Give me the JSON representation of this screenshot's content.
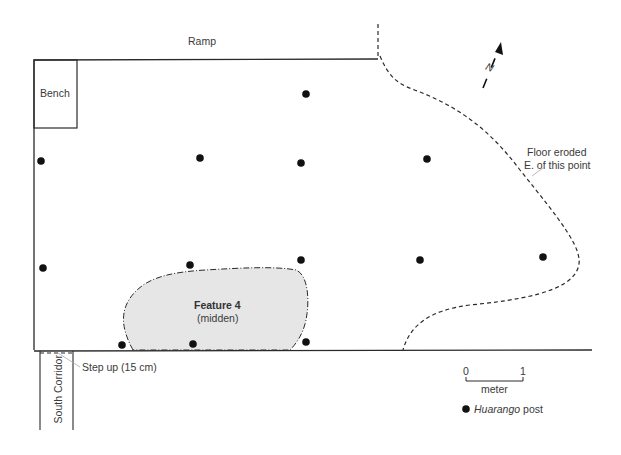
{
  "labels": {
    "ramp": "Ramp",
    "bench": "Bench",
    "north": "N",
    "eroded_line1": "Floor eroded",
    "eroded_line2": "E. of this point",
    "feature_title": "Feature 4",
    "feature_sub": "(midden)",
    "step_up": "Step up (15 cm)",
    "south_corridor": "South Corridor",
    "scale_0": "0",
    "scale_1": "1",
    "scale_unit": "meter",
    "legend_italic": "Huarango",
    "legend_rest": " post"
  },
  "colors": {
    "line": "#2a2a2a",
    "post": "#111111",
    "midden_fill": "#e6e6e6",
    "leader": "#aaaaaa"
  },
  "posts": [
    {
      "x": 306,
      "y": 94
    },
    {
      "x": 41,
      "y": 161
    },
    {
      "x": 200,
      "y": 158
    },
    {
      "x": 301,
      "y": 163
    },
    {
      "x": 427,
      "y": 159
    },
    {
      "x": 43,
      "y": 268
    },
    {
      "x": 190,
      "y": 265
    },
    {
      "x": 301,
      "y": 260
    },
    {
      "x": 420,
      "y": 260
    },
    {
      "x": 543,
      "y": 257
    },
    {
      "x": 122,
      "y": 345
    },
    {
      "x": 193,
      "y": 344
    },
    {
      "x": 306,
      "y": 342
    }
  ]
}
